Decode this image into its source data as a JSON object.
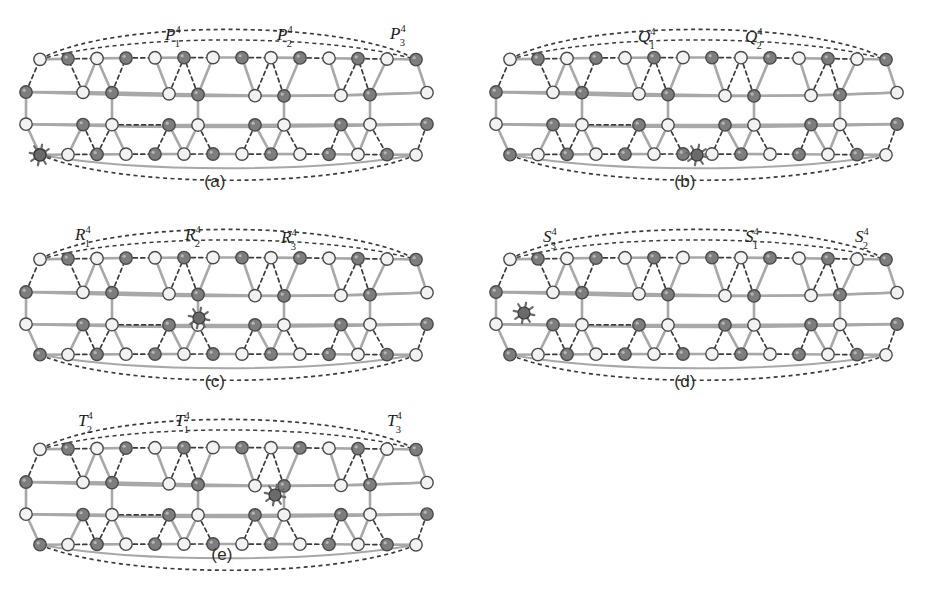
{
  "figure": {
    "background": "#ffffff",
    "panel_count": 5
  },
  "style": {
    "node_light_fill": "#f2f2f2",
    "node_dark_fill": "#7d7d7d",
    "node_stroke": "#4a4a4a",
    "solid_edge_color": "#a8a8a8",
    "dashed_edge_color": "#3b3b3b",
    "star_fill": "#6a6a6a",
    "label_color": "#1c1c1c",
    "caption_color": "#2b2b2b",
    "node_radius": 6.2,
    "star_radius": 6.0
  },
  "panels": [
    {
      "id": "a",
      "caption": "(a)",
      "caption_x": 215,
      "caption_y": 172,
      "origin_x": 0,
      "origin_y": 0,
      "labels": [
        {
          "name": "label-p1",
          "base": "P",
          "sub": "1",
          "sup": "4",
          "x": 165,
          "y": 26
        },
        {
          "name": "label-p2",
          "base": "P",
          "sub": "2",
          "sup": "4",
          "x": 277,
          "y": 26
        },
        {
          "name": "label-p3",
          "base": "P",
          "sub": "3",
          "sup": "4",
          "x": 390,
          "y": 25
        }
      ],
      "star": {
        "name": "star-node",
        "x": 40,
        "y": 155
      }
    },
    {
      "id": "b",
      "caption": "(b)",
      "caption_x": 685,
      "caption_y": 172,
      "origin_x": 470,
      "origin_y": 0,
      "labels": [
        {
          "name": "label-q1",
          "base": "Q",
          "sub": "1",
          "sup": "4",
          "x": 638,
          "y": 28
        },
        {
          "name": "label-q2",
          "base": "Q",
          "sub": "2",
          "sup": "4",
          "x": 745,
          "y": 28
        }
      ],
      "star": {
        "name": "star-node",
        "x": 697,
        "y": 155
      }
    },
    {
      "id": "c",
      "caption": "(c)",
      "caption_x": 215,
      "caption_y": 372,
      "origin_x": 0,
      "origin_y": 200,
      "labels": [
        {
          "name": "label-r1",
          "base": "R",
          "sub": "1",
          "sup": "4",
          "x": 75,
          "y": 226
        },
        {
          "name": "label-r2",
          "base": "R",
          "sub": "2",
          "sup": "4",
          "x": 185,
          "y": 226
        },
        {
          "name": "label-r3",
          "base": "R",
          "sub": "3",
          "sup": "4",
          "x": 281,
          "y": 229
        }
      ],
      "star": {
        "name": "star-node",
        "x": 199,
        "y": 318
      }
    },
    {
      "id": "d",
      "caption": "(d)",
      "caption_x": 685,
      "caption_y": 372,
      "origin_x": 470,
      "origin_y": 200,
      "labels": [
        {
          "name": "label-s3",
          "base": "S",
          "sub": "3",
          "sup": "4",
          "x": 543,
          "y": 228
        },
        {
          "name": "label-s1",
          "base": "S",
          "sub": "1",
          "sup": "4",
          "x": 745,
          "y": 228
        },
        {
          "name": "label-s2",
          "base": "S",
          "sub": "2",
          "sup": "4",
          "x": 855,
          "y": 228
        }
      ],
      "star": {
        "name": "star-node",
        "x": 524,
        "y": 313
      }
    },
    {
      "id": "e",
      "caption": "(e)",
      "caption_x": 222,
      "caption_y": 545,
      "origin_x": 0,
      "origin_y": 390,
      "labels": [
        {
          "name": "label-t2",
          "base": "T",
          "sub": "2",
          "sup": "4",
          "x": 78,
          "y": 412
        },
        {
          "name": "label-t1",
          "base": "T",
          "sub": "1",
          "sup": "4",
          "x": 175,
          "y": 412
        },
        {
          "name": "label-t3",
          "base": "T",
          "sub": "3",
          "sup": "4",
          "x": 387,
          "y": 412
        }
      ],
      "star": {
        "name": "star-node",
        "x": 275,
        "y": 495
      }
    }
  ],
  "graph_geometry": {
    "comment": "Shared honeycomb lattice used by every panel; coordinates are local to each panel origin.",
    "rows": [
      {
        "row": 0,
        "y": 60,
        "columns": [
          40,
          68,
          97,
          126,
          155,
          184,
          213,
          242,
          271,
          300,
          329,
          358,
          387,
          416
        ],
        "colors": [
          "light",
          "dark",
          "light",
          "dark",
          "light",
          "dark",
          "light",
          "dark",
          "light",
          "dark",
          "light",
          "dark",
          "light",
          "dark"
        ]
      },
      {
        "row": 1,
        "y": 92,
        "columns": [
          26,
          83,
          112,
          169,
          198,
          255,
          284,
          341,
          370,
          427
        ],
        "colors": [
          "dark",
          "light",
          "dark",
          "light",
          "dark",
          "light",
          "dark",
          "light",
          "dark",
          "light"
        ]
      },
      {
        "row": 2,
        "y": 124,
        "columns": [
          26,
          83,
          112,
          169,
          198,
          255,
          284,
          341,
          370,
          427
        ],
        "colors": [
          "light",
          "dark",
          "light",
          "dark",
          "light",
          "dark",
          "light",
          "dark",
          "light",
          "dark"
        ]
      },
      {
        "row": 3,
        "y": 155,
        "columns": [
          40,
          68,
          97,
          126,
          155,
          184,
          213,
          242,
          271,
          300,
          329,
          358,
          387,
          416
        ],
        "colors": [
          "dark",
          "light",
          "dark",
          "light",
          "dark",
          "light",
          "dark",
          "light",
          "dark",
          "light",
          "dark",
          "light",
          "dark",
          "light"
        ]
      }
    ]
  }
}
